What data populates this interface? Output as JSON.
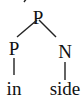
{
  "diagram": {
    "type": "syntax-tree",
    "root": {
      "label": "P"
    },
    "children": [
      {
        "label": "P",
        "leaf": "in"
      },
      {
        "label": "N",
        "leaf": "side"
      }
    ]
  }
}
